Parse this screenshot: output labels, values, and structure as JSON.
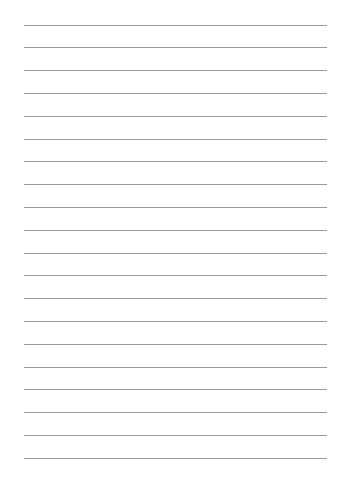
{
  "page": {
    "type": "lined-paper",
    "background": "#ffffff",
    "line_color": "#9a9a9a",
    "line_count": 20,
    "first_line_y": 24.5,
    "line_spacing": 22.8,
    "line_left": 24,
    "line_right": 327
  }
}
